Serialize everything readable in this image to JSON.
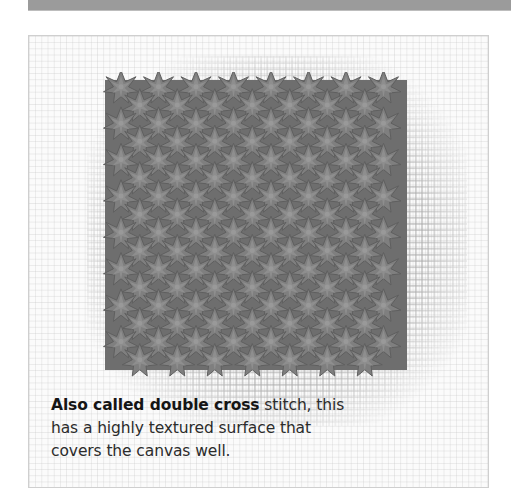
{
  "header": {
    "bar_color": "#9b9b9b"
  },
  "figure": {
    "name": "double cross stitch sample",
    "stitch_color": "#7d7d7d",
    "stitch_shadow_color": "#5a5a5a",
    "stitch_highlight_color": "#a0a0a0",
    "canvas_color": "#fbfbfb",
    "columns": 8,
    "rows": 16
  },
  "caption": {
    "bold_text": "Also called double cross",
    "line1_rest": " stitch, this",
    "line2": "has a highly textured surface that",
    "line3": "covers the canvas well."
  }
}
